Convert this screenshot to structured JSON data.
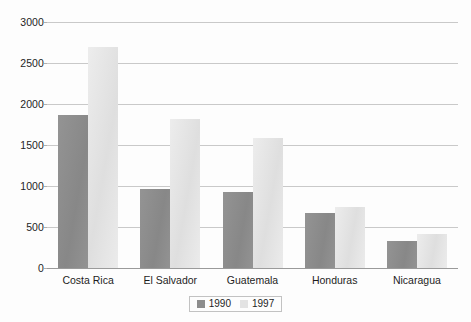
{
  "chart_data": {
    "type": "bar",
    "title": "",
    "subtitle": "",
    "xlabel": "",
    "ylabel": "",
    "ylim": [
      0,
      3000
    ],
    "ytick_labels": [
      "3000",
      "2500",
      "2000",
      "1500",
      "1000",
      "500",
      "0"
    ],
    "ytick_values": [
      3000,
      2500,
      2000,
      1500,
      1000,
      500,
      0
    ],
    "grid": true,
    "legend_position": "bottom-center",
    "categories": [
      "Costa Rica",
      "El Salvador",
      "Guatemala",
      "Honduras",
      "Nicaragua"
    ],
    "series": [
      {
        "name": "1990",
        "color": "#8d8d8d",
        "values": [
          1870,
          965,
          930,
          670,
          335
        ]
      },
      {
        "name": "1997",
        "color": "#e3e3e3",
        "values": [
          2690,
          1820,
          1590,
          750,
          420
        ]
      }
    ]
  },
  "legend": {
    "items": [
      {
        "label": "1990",
        "color": "#8d8d8d"
      },
      {
        "label": "1997",
        "color": "#e3e3e3"
      }
    ]
  },
  "colors": {
    "gridline": "#c9c9c9",
    "axis": "#9a9a9a",
    "text": "#1d1d1d",
    "background": "#fdfdfd",
    "series_1990": "#8d8d8d",
    "series_1997": "#e3e3e3"
  }
}
